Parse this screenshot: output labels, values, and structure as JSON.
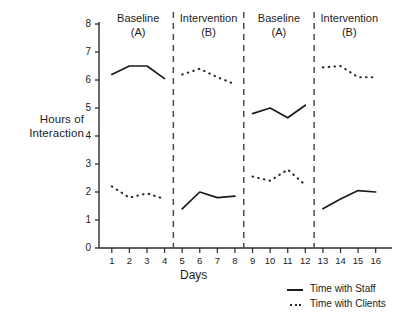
{
  "chart_data": {
    "type": "line",
    "title": "",
    "xlabel": "Days",
    "ylabel": "Hours of Interaction",
    "xlim": [
      0.4,
      16.6
    ],
    "ylim": [
      0,
      8
    ],
    "grid": false,
    "legend_position": "bottom-right",
    "x": [
      1,
      2,
      3,
      4,
      5,
      6,
      7,
      8,
      9,
      10,
      11,
      12,
      13,
      14,
      15,
      16
    ],
    "y_ticks": [
      0,
      1,
      2,
      3,
      4,
      5,
      6,
      7,
      8
    ],
    "x_tick_labels": [
      "1",
      "2",
      "3",
      "4",
      "5",
      "6",
      "7",
      "8",
      "9",
      "10",
      "11",
      "12",
      "13",
      "14",
      "15",
      "16"
    ],
    "y_tick_labels": [
      "0",
      "1",
      "2",
      "3",
      "4",
      "5",
      "6",
      "7",
      "8"
    ],
    "series": [
      {
        "name": "Time with Staff",
        "style": "solid",
        "color": "#1a1a1a",
        "segments": [
          {
            "x": [
              1,
              2,
              3,
              4
            ],
            "values": [
              6.2,
              6.5,
              6.5,
              6.05
            ]
          },
          {
            "x": [
              5,
              6,
              7,
              8
            ],
            "values": [
              1.4,
              2.0,
              1.8,
              1.85
            ]
          },
          {
            "x": [
              9,
              10,
              11,
              12
            ],
            "values": [
              4.8,
              5.0,
              4.65,
              5.1
            ]
          },
          {
            "x": [
              13,
              14,
              15,
              16
            ],
            "values": [
              1.4,
              1.75,
              2.05,
              2.0
            ]
          }
        ]
      },
      {
        "name": "Time with Clients",
        "style": "dotted",
        "color": "#2b2b2b",
        "segments": [
          {
            "x": [
              1,
              2,
              3,
              4
            ],
            "values": [
              2.2,
              1.8,
              1.95,
              1.75
            ]
          },
          {
            "x": [
              5,
              6,
              7,
              8
            ],
            "values": [
              6.2,
              6.4,
              6.1,
              5.85
            ]
          },
          {
            "x": [
              9,
              10,
              11,
              12
            ],
            "values": [
              2.55,
              2.4,
              2.8,
              2.25
            ]
          },
          {
            "x": [
              13,
              14,
              15,
              16
            ],
            "values": [
              6.45,
              6.5,
              6.1,
              6.1
            ]
          }
        ]
      }
    ],
    "phase_dividers": [
      4.5,
      8.5,
      12.5
    ],
    "phases": [
      {
        "line1": "Baseline",
        "line2": "(A)",
        "x_center": 2.5
      },
      {
        "line1": "Intervention",
        "line2": "(B)",
        "x_center": 6.5
      },
      {
        "line1": "Baseline",
        "line2": "(A)",
        "x_center": 10.5
      },
      {
        "line1": "Intervention",
        "line2": "(B)",
        "x_center": 14.5
      }
    ],
    "legend_entries": [
      {
        "label": "Time with Staff",
        "style": "solid"
      },
      {
        "label": "Time with Clients",
        "style": "dotted"
      }
    ]
  }
}
